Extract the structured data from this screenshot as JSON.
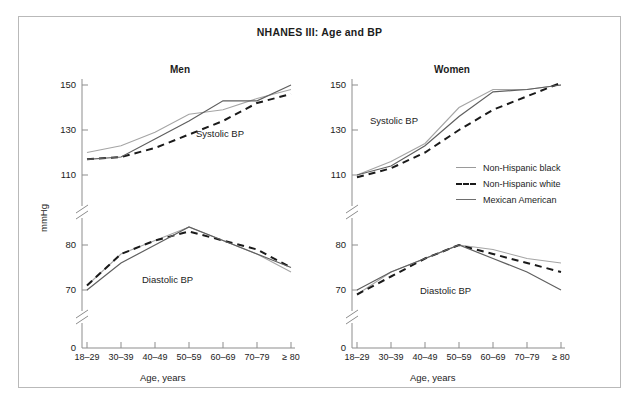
{
  "chart_title": "NHANES III: Age and BP",
  "axes": {
    "ylabel": "mmHg",
    "xlabel": "Age, years",
    "yticks_upper": [
      "150",
      "130",
      "110"
    ],
    "yticks_lower": [
      "80",
      "70"
    ],
    "ytick_zero": "0",
    "xticks": [
      "18–29",
      "30–39",
      "40–49",
      "50–59",
      "60–69",
      "70–79",
      "≥ 80"
    ]
  },
  "panels": {
    "men": {
      "title": "Men",
      "systolic_label": "Systolic BP",
      "diastolic_label": "Diastolic BP"
    },
    "women": {
      "title": "Women",
      "systolic_label": "Systolic BP",
      "diastolic_label": "Diastolic BP"
    }
  },
  "legend": {
    "items": [
      {
        "label": "Non-Hispanic black",
        "style": "solid",
        "color": "#a5a5a5"
      },
      {
        "label": "Non-Hispanic white",
        "style": "dashed",
        "color": "#1a1a1a"
      },
      {
        "label": "Mexican American",
        "style": "solid",
        "color": "#5f5f5f"
      }
    ]
  },
  "chart_data": {
    "type": "line",
    "title": "NHANES III: Age and BP",
    "xlabel": "Age, years",
    "ylabel": "mmHg",
    "categories": [
      "18–29",
      "30–39",
      "40–49",
      "50–59",
      "60–69",
      "70–79",
      "≥ 80"
    ],
    "axis_break": true,
    "grid": false,
    "legend_position": "center-right",
    "ylim_upper": [
      108,
      152
    ],
    "ylim_lower": [
      66,
      86
    ],
    "panels": [
      {
        "panel": "Men",
        "measures": [
          {
            "measure": "Systolic BP",
            "series": [
              {
                "name": "Non-Hispanic black",
                "values": [
                  120,
                  123,
                  129,
                  137,
                  139,
                  144,
                  148
                ]
              },
              {
                "name": "Non-Hispanic white",
                "values": [
                  117,
                  118,
                  122,
                  128,
                  134,
                  142,
                  146
                ]
              },
              {
                "name": "Mexican American",
                "values": [
                  117,
                  118,
                  126,
                  134,
                  143,
                  143,
                  150
                ]
              }
            ]
          },
          {
            "measure": "Diastolic BP",
            "series": [
              {
                "name": "Non-Hispanic black",
                "values": [
                  71,
                  78,
                  81,
                  84,
                  81,
                  78,
                  74
                ]
              },
              {
                "name": "Non-Hispanic white",
                "values": [
                  71,
                  78,
                  81,
                  83,
                  81,
                  79,
                  75
                ]
              },
              {
                "name": "Mexican American",
                "values": [
                  70,
                  76,
                  80,
                  84,
                  81,
                  78,
                  75
                ]
              }
            ]
          }
        ]
      },
      {
        "panel": "Women",
        "measures": [
          {
            "measure": "Systolic BP",
            "series": [
              {
                "name": "Non-Hispanic black",
                "values": [
                  110,
                  116,
                  124,
                  140,
                  148,
                  148,
                  150
                ]
              },
              {
                "name": "Non-Hispanic white",
                "values": [
                  109,
                  113,
                  120,
                  130,
                  139,
                  145,
                  151
                ]
              },
              {
                "name": "Mexican American",
                "values": [
                  110,
                  114,
                  123,
                  136,
                  147,
                  148,
                  150
                ]
              }
            ]
          },
          {
            "measure": "Diastolic BP",
            "series": [
              {
                "name": "Non-Hispanic black",
                "values": [
                  69,
                  74,
                  77,
                  80,
                  79,
                  77,
                  76
                ]
              },
              {
                "name": "Non-Hispanic white",
                "values": [
                  69,
                  73,
                  77,
                  80,
                  78,
                  76,
                  74
                ]
              },
              {
                "name": "Mexican American",
                "values": [
                  70,
                  74,
                  77,
                  80,
                  77,
                  74,
                  70
                ]
              }
            ]
          }
        ]
      }
    ]
  }
}
